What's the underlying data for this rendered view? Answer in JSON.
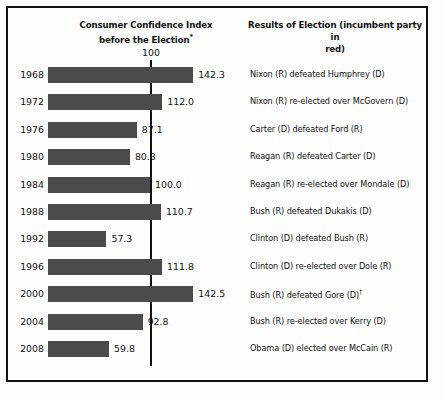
{
  "figure": {
    "background_color": "#fdfdfd",
    "frame_color": "#111111",
    "bar_color": "#4b4b4b",
    "text_color": "#111111"
  },
  "headers": {
    "left_line1": "Consumer Confidence Index",
    "left_line2": "before the Election",
    "left_superscript": "*",
    "right_line1": "Results of Election (incumbent party in",
    "right_line2": "red)"
  },
  "axis": {
    "reference_label": "100",
    "reference_value": 100
  },
  "footnote_marker_gore": "†",
  "chart_data": {
    "type": "bar",
    "title": "Consumer Confidence Index before the Election*",
    "xlabel": "",
    "ylabel": "",
    "orientation": "horizontal",
    "grid": false,
    "legend": "none",
    "xlim": [
      0,
      150
    ],
    "reference_line": 100,
    "categories": [
      "1968",
      "1972",
      "1976",
      "1980",
      "1984",
      "1988",
      "1992",
      "1996",
      "2000",
      "2004",
      "2008"
    ],
    "values": [
      142.3,
      112.0,
      87.1,
      80.3,
      100.0,
      110.7,
      57.3,
      111.8,
      142.5,
      92.8,
      59.8
    ],
    "value_labels": [
      "142.3",
      "112.0",
      "87.1",
      "80.3",
      "100.0",
      "110.7",
      "57.3",
      "111.8",
      "142.5",
      "92.8",
      "59.8"
    ],
    "annotations": [
      "Nixon (R) defeated Humphrey (D)",
      "Nixon (R) re-elected over McGovern (D)",
      "Carter (D) defeated Ford (R)",
      "Reagan (R) defeated Carter (D)",
      "Reagan (R) re-elected over Mondale (D)",
      "Bush (R) defeated Dukakis (D)",
      "Clinton (D) defeated Bush (R)",
      "Clinton (D) re-elected over Dole (R)",
      "Bush (R) defeated Gore (D)",
      "Bush (R) re-elected over Kerry (D)",
      "Obama (D) elected over McCain (R)"
    ]
  },
  "rows": [
    {
      "year": "1968",
      "value": 142.3,
      "value_label": "142.3",
      "result": "Nixon (R) defeated Humphrey (D)"
    },
    {
      "year": "1972",
      "value": 112.0,
      "value_label": "112.0",
      "result": "Nixon (R) re-elected over McGovern (D)"
    },
    {
      "year": "1976",
      "value": 87.1,
      "value_label": "87.1",
      "result": "Carter (D) defeated Ford (R)"
    },
    {
      "year": "1980",
      "value": 80.3,
      "value_label": "80.3",
      "result": "Reagan (R) defeated Carter (D)"
    },
    {
      "year": "1984",
      "value": 100.0,
      "value_label": "100.0",
      "result": "Reagan (R) re-elected over Mondale (D)"
    },
    {
      "year": "1988",
      "value": 110.7,
      "value_label": "110.7",
      "result": "Bush (R) defeated Dukakis (D)"
    },
    {
      "year": "1992",
      "value": 57.3,
      "value_label": "57.3",
      "result": "Clinton (D) defeated Bush (R)"
    },
    {
      "year": "1996",
      "value": 111.8,
      "value_label": "111.8",
      "result": "Clinton (D) re-elected over Dole (R)"
    },
    {
      "year": "2000",
      "value": 142.5,
      "value_label": "142.5",
      "result": "Bush (R) defeated Gore (D)",
      "result_superscript": "†"
    },
    {
      "year": "2004",
      "value": 92.8,
      "value_label": "92.8",
      "result": "Bush (R) re-elected over Kerry (D)"
    },
    {
      "year": "2008",
      "value": 59.8,
      "value_label": "59.8",
      "result": "Obama (D) elected over McCain (R)"
    }
  ]
}
